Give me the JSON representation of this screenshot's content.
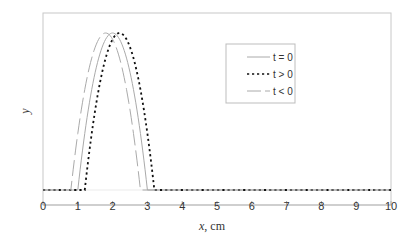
{
  "chart_data": {
    "type": "line",
    "title": "",
    "xlabel": "x",
    "xlabel_unit": ", cm",
    "ylabel": "y",
    "xlim": [
      0,
      10
    ],
    "ylim": [
      0,
      1
    ],
    "x_ticks": [
      0,
      1,
      2,
      3,
      4,
      5,
      6,
      7,
      8,
      9,
      10
    ],
    "x_tick_labels": [
      "0",
      "1",
      "2",
      "3",
      "4",
      "5",
      "6",
      "7",
      "8",
      "9",
      "10"
    ],
    "y_ticks": [],
    "grid": false,
    "legend_position": "upper-right-inside",
    "series": [
      {
        "name": "t = 0",
        "style": "solid",
        "color": "#aaaaaa",
        "x": [
          0,
          1.0,
          1.25,
          1.5,
          1.75,
          2.0,
          2.25,
          2.5,
          2.75,
          3.0,
          10
        ],
        "y": [
          0,
          0,
          0.4375,
          0.75,
          0.9375,
          1.0,
          0.9375,
          0.75,
          0.4375,
          0,
          0
        ]
      },
      {
        "name": "t > 0",
        "style": "dotted",
        "color": "#111111",
        "x": [
          0,
          1.2,
          1.45,
          1.7,
          1.95,
          2.2,
          2.45,
          2.7,
          2.95,
          3.2,
          10
        ],
        "y": [
          0,
          0,
          0.4375,
          0.75,
          0.9375,
          1.0,
          0.9375,
          0.75,
          0.4375,
          0,
          0
        ]
      },
      {
        "name": "t < 0",
        "style": "long-dash",
        "color": "#aaaaaa",
        "x": [
          0,
          0.8,
          1.05,
          1.3,
          1.55,
          1.8,
          2.05,
          2.3,
          2.55,
          2.8,
          10
        ],
        "y": [
          0,
          0,
          0.4375,
          0.75,
          0.9375,
          1.0,
          0.9375,
          0.75,
          0.4375,
          0,
          0
        ]
      }
    ]
  },
  "legend": {
    "items": [
      {
        "label": "t = 0"
      },
      {
        "label": "t > 0"
      },
      {
        "label": "t < 0"
      }
    ]
  },
  "axes": {
    "x_title": "x",
    "x_unit": ", cm",
    "y_title": "y"
  }
}
